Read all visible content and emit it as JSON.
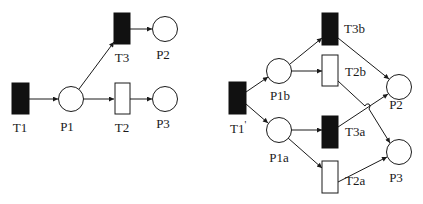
{
  "diagram": {
    "type": "petri-net",
    "left_net": {
      "transitions": [
        {
          "id": "T1",
          "label": "T1",
          "filled": true
        },
        {
          "id": "T3",
          "label": "T3",
          "filled": true
        },
        {
          "id": "T2",
          "label": "T2",
          "filled": false
        }
      ],
      "places": [
        {
          "id": "P1",
          "label": "P1"
        },
        {
          "id": "P2",
          "label": "P2"
        },
        {
          "id": "P3",
          "label": "P3"
        }
      ],
      "arcs": [
        [
          "T1",
          "P1"
        ],
        [
          "P1",
          "T3"
        ],
        [
          "P1",
          "T2"
        ],
        [
          "T3",
          "P2"
        ],
        [
          "T2",
          "P3"
        ]
      ]
    },
    "right_net": {
      "transitions": [
        {
          "id": "T1p",
          "label": "T1",
          "superscript": "'",
          "filled": true
        },
        {
          "id": "T3b",
          "label": "T3b",
          "filled": true
        },
        {
          "id": "T2b",
          "label": "T2b",
          "filled": false
        },
        {
          "id": "T3a",
          "label": "T3a",
          "filled": true
        },
        {
          "id": "T2a",
          "label": "T2a",
          "filled": false
        }
      ],
      "places": [
        {
          "id": "P1b",
          "label": "P1b"
        },
        {
          "id": "P1a",
          "label": "P1a"
        },
        {
          "id": "P2",
          "label": "P2"
        },
        {
          "id": "P3",
          "label": "P3"
        }
      ],
      "arcs": [
        [
          "T1p",
          "P1b"
        ],
        [
          "T1p",
          "P1a"
        ],
        [
          "P1b",
          "T3b"
        ],
        [
          "P1b",
          "T2b"
        ],
        [
          "P1a",
          "T3a"
        ],
        [
          "P1a",
          "T2a"
        ],
        [
          "T3b",
          "P2"
        ],
        [
          "T3a",
          "P2"
        ],
        [
          "T2b",
          "P3"
        ],
        [
          "T2a",
          "P3"
        ]
      ]
    }
  }
}
